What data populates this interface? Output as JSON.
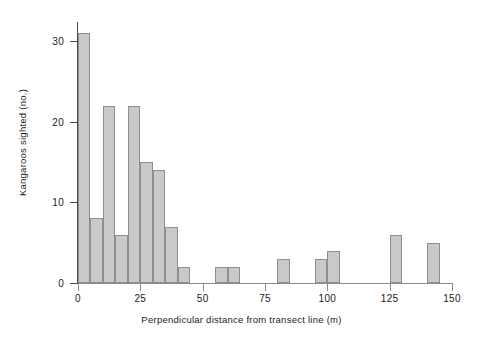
{
  "chart_data": {
    "type": "bar",
    "title": "",
    "subtitle": "",
    "xlabel": "Perpendicular distance from transect line (m)",
    "ylabel": "Kangaroos sighted (no.)",
    "xlim": [
      0,
      150
    ],
    "ylim": [
      0,
      32
    ],
    "xticks": [
      0,
      25,
      50,
      75,
      100,
      125,
      150
    ],
    "xtick_labels": [
      "0",
      "25",
      "50",
      "75",
      "100",
      "125",
      "150"
    ],
    "yticks": [
      0,
      10,
      20,
      30
    ],
    "ytick_labels": [
      "0",
      "10",
      "20",
      "30"
    ],
    "grid": false,
    "legend": false,
    "legend_position": "none",
    "bin_width": 5,
    "bar_color": "#c9c9c9",
    "bar_edge_color": "#8e8e8e",
    "axis_color": "#4a4a4a",
    "bins": [
      {
        "label": "0-5",
        "start": 0,
        "end": 5,
        "value": 31
      },
      {
        "label": "5-10",
        "start": 5,
        "end": 10,
        "value": 8
      },
      {
        "label": "10-15",
        "start": 10,
        "end": 15,
        "value": 22
      },
      {
        "label": "15-20",
        "start": 15,
        "end": 20,
        "value": 6
      },
      {
        "label": "20-25",
        "start": 20,
        "end": 25,
        "value": 22
      },
      {
        "label": "25-30",
        "start": 25,
        "end": 30,
        "value": 15
      },
      {
        "label": "30-35",
        "start": 30,
        "end": 35,
        "value": 14
      },
      {
        "label": "35-40",
        "start": 35,
        "end": 40,
        "value": 7
      },
      {
        "label": "40-45",
        "start": 40,
        "end": 45,
        "value": 2
      },
      {
        "label": "45-50",
        "start": 45,
        "end": 50,
        "value": 0
      },
      {
        "label": "50-55",
        "start": 50,
        "end": 55,
        "value": 0
      },
      {
        "label": "55-60",
        "start": 55,
        "end": 60,
        "value": 2
      },
      {
        "label": "60-65",
        "start": 60,
        "end": 65,
        "value": 2
      },
      {
        "label": "65-70",
        "start": 65,
        "end": 70,
        "value": 0
      },
      {
        "label": "70-75",
        "start": 70,
        "end": 75,
        "value": 0
      },
      {
        "label": "75-80",
        "start": 75,
        "end": 80,
        "value": 0
      },
      {
        "label": "80-85",
        "start": 80,
        "end": 85,
        "value": 3
      },
      {
        "label": "85-90",
        "start": 85,
        "end": 90,
        "value": 0
      },
      {
        "label": "90-95",
        "start": 90,
        "end": 95,
        "value": 0
      },
      {
        "label": "95-100",
        "start": 95,
        "end": 100,
        "value": 3
      },
      {
        "label": "100-105",
        "start": 100,
        "end": 105,
        "value": 4
      },
      {
        "label": "105-110",
        "start": 105,
        "end": 110,
        "value": 0
      },
      {
        "label": "110-115",
        "start": 110,
        "end": 115,
        "value": 0
      },
      {
        "label": "115-120",
        "start": 115,
        "end": 120,
        "value": 0
      },
      {
        "label": "120-125",
        "start": 120,
        "end": 125,
        "value": 0
      },
      {
        "label": "125-130",
        "start": 125,
        "end": 130,
        "value": 6
      },
      {
        "label": "130-135",
        "start": 130,
        "end": 135,
        "value": 0
      },
      {
        "label": "135-140",
        "start": 135,
        "end": 140,
        "value": 0
      },
      {
        "label": "140-145",
        "start": 140,
        "end": 145,
        "value": 5
      },
      {
        "label": "145-150",
        "start": 145,
        "end": 150,
        "value": 0
      }
    ]
  }
}
